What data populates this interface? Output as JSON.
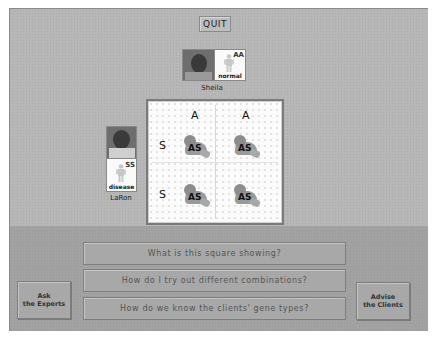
{
  "toolbar": {
    "quit_label": "QUIT"
  },
  "clients": {
    "mother": {
      "name": "Sheila",
      "genotype": "AA",
      "status": "normal"
    },
    "father": {
      "name": "LaRon",
      "genotype": "SS",
      "status": "disease"
    }
  },
  "punnett": {
    "column_alleles": [
      "A",
      "A"
    ],
    "row_alleles": [
      "S",
      "S"
    ],
    "cells": [
      "AS",
      "AS",
      "AS",
      "AS"
    ]
  },
  "questions": [
    "What is this square showing?",
    "How do I try out different combinations?",
    "How do we know the clients' gene types?"
  ],
  "actions": {
    "ask_experts": {
      "line1": "Ask",
      "line2": "the Experts"
    },
    "advise_clients": {
      "line1": "Advise",
      "line2": "the Clients"
    }
  },
  "colors": {
    "panel_upper": "#b7b7b7",
    "panel_lower": "#a2a2a2",
    "square_bg": "#fbfbfb"
  }
}
